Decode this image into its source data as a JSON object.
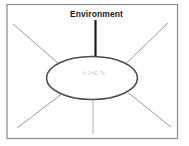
{
  "diagram": {
    "title_label": "Environment",
    "ellipse_faint_text": "4.1HE Ts"
  },
  "colors": {
    "background": "#ffffff",
    "frame_border": "#8a8a8a",
    "connector_dark": "#1c1c1c",
    "ellipse_stroke": "#4d4d4d",
    "ellipse_fill": "#ffffff",
    "radiating_line": "#9a9a9a",
    "bottom_line": "#aeaeae",
    "label_text": "#1a1a1a",
    "faint_text": "#c9c9c9"
  }
}
